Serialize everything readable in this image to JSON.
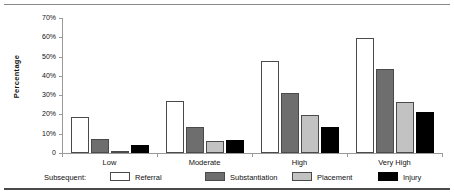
{
  "chart_data": {
    "type": "bar",
    "title": "",
    "xlabel": "",
    "ylabel": "Percentage",
    "ylim": [
      0,
      70
    ],
    "ytick_labels": [
      "70%",
      "60%",
      "50%",
      "40%",
      "30%",
      "20%",
      "10%",
      "0"
    ],
    "ytick_values": [
      70,
      60,
      50,
      40,
      30,
      20,
      10,
      0
    ],
    "grid": false,
    "legend_position": "bottom",
    "legend_title": "Subsequent:",
    "categories": [
      "Low",
      "Moderate",
      "High",
      "Very High"
    ],
    "series": [
      {
        "name": "Referral",
        "color": "#ffffff",
        "values": [
          18.5,
          27.0,
          47.5,
          59.5
        ]
      },
      {
        "name": "Substantiation",
        "color": "#6e6e6e",
        "values": [
          7.5,
          13.5,
          31.0,
          43.5
        ]
      },
      {
        "name": "Placement",
        "color": "#c2c2c2",
        "values": [
          1.0,
          6.0,
          19.5,
          26.5
        ]
      },
      {
        "name": "Injury",
        "color": "#000000",
        "values": [
          4.0,
          6.5,
          13.5,
          21.5
        ]
      }
    ]
  },
  "axis": {
    "y_title": "Percentage",
    "ticks": [
      {
        "label": "70%",
        "value": 70
      },
      {
        "label": "60%",
        "value": 60
      },
      {
        "label": "50%",
        "value": 50
      },
      {
        "label": "40%",
        "value": 40
      },
      {
        "label": "30%",
        "value": 30
      },
      {
        "label": "20%",
        "value": 20
      },
      {
        "label": "10%",
        "value": 10
      },
      {
        "label": "0",
        "value": 0
      }
    ]
  },
  "categories": [
    {
      "label": "Low"
    },
    {
      "label": "Moderate"
    },
    {
      "label": "High"
    },
    {
      "label": "Very High"
    }
  ],
  "legend": {
    "title": "Subsequent:",
    "items": [
      {
        "label": "Referral",
        "key": "referral"
      },
      {
        "label": "Substantiation",
        "key": "substantiation"
      },
      {
        "label": "Placement",
        "key": "placement"
      },
      {
        "label": "Injury",
        "key": "injury"
      }
    ]
  },
  "colors": {
    "referral": "#ffffff",
    "substantiation": "#6e6e6e",
    "placement": "#c2c2c2",
    "injury": "#000000",
    "axis": "#9a9a9a",
    "outline": "#4a4a4a",
    "text": "#111111"
  }
}
